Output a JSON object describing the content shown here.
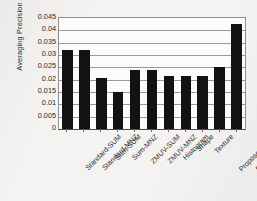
{
  "chart_data": {
    "type": "bar",
    "title": "",
    "xlabel": "",
    "ylabel": "Averaging Precision",
    "ylim": [
      0,
      0.045
    ],
    "grid": true,
    "legend": "none",
    "orientation": "vertical",
    "bar_color": "#121212",
    "ytick_labels": [
      "0.045",
      "0.04",
      "0.035",
      "0.03",
      "0.025",
      "0.02",
      "0.015",
      "0.01",
      "0.005",
      "0"
    ],
    "ytick_values": [
      0.045,
      0.04,
      0.035,
      0.03,
      0.025,
      0.02,
      0.015,
      0.01,
      0.005,
      0
    ],
    "categories": [
      "Standard-SUM",
      "Standard-MNZ",
      "Sum-SUM",
      "Sum-MNZ",
      "ZMUV-SUM",
      "ZMUV-MNZ",
      "Histogram",
      "Shape",
      "Texture",
      "Proposed-SUM",
      "Proposed-MNZ"
    ],
    "values": [
      0.032,
      0.032,
      0.0205,
      0.0152,
      0.0238,
      0.0238,
      0.0215,
      0.0214,
      0.0214,
      0.025,
      0.0426
    ]
  },
  "colors": {
    "bar": "#121212",
    "gridline": "#9a9a9a",
    "axis": "#4a4a4a",
    "text": "#2a2a2a",
    "plot_background": "#fbfbfa",
    "page_background": "#f4f3f1"
  }
}
